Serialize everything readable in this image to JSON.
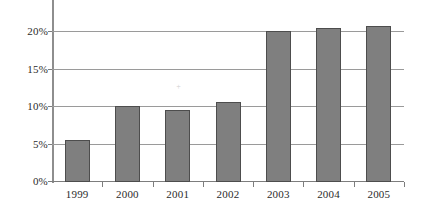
{
  "chart_data": {
    "type": "bar",
    "title": "",
    "subtitle": "",
    "xlabel": "",
    "ylabel": "",
    "categories": [
      "1999",
      "2000",
      "2001",
      "2002",
      "2003",
      "2004",
      "2005"
    ],
    "values": [
      5.6,
      10.2,
      9.6,
      10.7,
      20.2,
      20.6,
      20.8
    ],
    "value_format": "percent",
    "ylim": [
      0,
      22.5
    ],
    "yticks": [
      0,
      5,
      10,
      15,
      20
    ],
    "ytick_labels": [
      "0%",
      "5%",
      "10%",
      "15%",
      "20%"
    ],
    "grid": true,
    "grid_axis": "y",
    "legend": null,
    "legend_position": "none",
    "series": [
      {
        "name": "",
        "values": [
          5.6,
          10.2,
          9.6,
          10.7,
          20.2,
          20.6,
          20.8
        ]
      }
    ],
    "colors": {
      "bar_fill": "#7f7f7f",
      "bar_border": "#4d4d4d",
      "gridline": "#9a9a9a",
      "axis": "#8e8e8e",
      "text": "#2b2b2b",
      "background": "#ffffff"
    },
    "annotations": []
  }
}
